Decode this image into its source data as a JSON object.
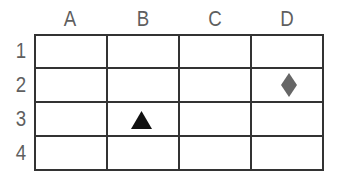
{
  "grid": {
    "columns": [
      "A",
      "B",
      "C",
      "D"
    ],
    "rows": [
      "1",
      "2",
      "3",
      "4"
    ]
  },
  "markers": [
    {
      "shape": "diamond",
      "column": "D",
      "row": "2",
      "color": "#666666"
    },
    {
      "shape": "triangle",
      "column": "B",
      "row": "3",
      "color": "#111111"
    }
  ],
  "colors": {
    "grid_line": "#333333",
    "label": "#5f5f5f",
    "background": "#ffffff"
  }
}
